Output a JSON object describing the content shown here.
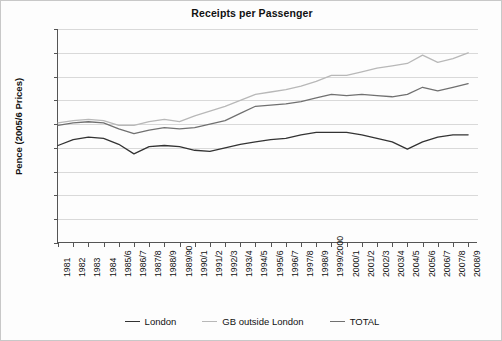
{
  "chart_data": {
    "type": "line",
    "title": "Receipts per Passenger",
    "xlabel": "",
    "ylabel": "Pence (2005/6 Prices)",
    "ylim": [
      0,
      90
    ],
    "ytick_step": 10,
    "yticks": [
      90,
      80,
      70,
      60,
      50,
      40,
      30,
      20,
      10,
      0
    ],
    "grid": true,
    "legend_position": "bottom",
    "categories": [
      "1981",
      "1982",
      "1983",
      "1984",
      "1985/6",
      "1986/7",
      "1987/8",
      "1988/9",
      "1989/90",
      "1990/1",
      "1991/2",
      "1992/3",
      "1993/4",
      "1994/5",
      "1995/6",
      "1996/7",
      "1997/8",
      "1998/9",
      "1999/2000",
      "2000/1",
      "2001/2",
      "2002/3",
      "2003/4",
      "2004/5",
      "2005/6",
      "2006/7",
      "2007/8",
      "2008/9"
    ],
    "series": [
      {
        "name": "London",
        "color": "#333333",
        "values": [
          41.0,
          43.5,
          44.5,
          44.0,
          41.5,
          37.5,
          40.5,
          41.0,
          40.5,
          39.0,
          38.5,
          40.0,
          41.5,
          42.5,
          43.5,
          44.0,
          45.5,
          46.5,
          46.5,
          46.5,
          45.5,
          44.0,
          42.5,
          39.5,
          42.5,
          44.5,
          45.5,
          45.5
        ]
      },
      {
        "name": "GB outside London",
        "color": "#b8b8b8",
        "values": [
          50.5,
          51.5,
          52.0,
          51.5,
          49.5,
          49.5,
          51.0,
          52.0,
          51.0,
          53.5,
          55.5,
          57.5,
          60.0,
          62.5,
          63.5,
          64.5,
          66.0,
          68.0,
          70.5,
          70.5,
          72.0,
          73.5,
          74.5,
          75.5,
          79.0,
          76.0,
          77.5,
          80.0
        ]
      },
      {
        "name": "TOTAL",
        "color": "#707070",
        "values": [
          49.5,
          50.5,
          51.0,
          50.5,
          48.0,
          46.0,
          47.5,
          48.5,
          48.0,
          48.5,
          50.0,
          51.5,
          54.5,
          57.5,
          58.0,
          58.5,
          59.5,
          61.0,
          62.5,
          62.0,
          62.5,
          62.0,
          61.5,
          62.5,
          65.5,
          64.0,
          65.5,
          67.0
        ]
      }
    ]
  },
  "legend": {
    "items": [
      {
        "label": "London"
      },
      {
        "label": "GB outside London"
      },
      {
        "label": "TOTAL"
      }
    ]
  }
}
